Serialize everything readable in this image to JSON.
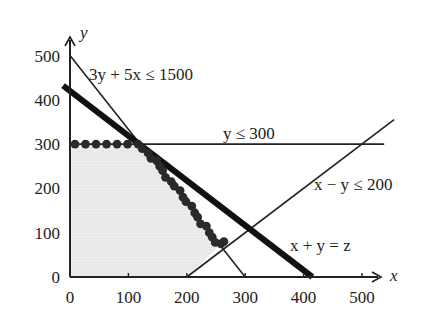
{
  "chart_data": {
    "type": "line",
    "title": "",
    "xlabel": "x",
    "ylabel": "y",
    "xlim": [
      0,
      540
    ],
    "ylim": [
      0,
      530
    ],
    "grid": false,
    "x_ticks": [
      0,
      100,
      200,
      300,
      400,
      500
    ],
    "y_ticks": [
      0,
      100,
      200,
      300,
      400,
      500
    ],
    "x_tick_labels": [
      "0",
      "100",
      "200",
      "300",
      "400",
      "500"
    ],
    "y_tick_labels": [
      "0",
      "100",
      "200",
      "300",
      "400",
      "500"
    ],
    "constraints": [
      {
        "name": "3y + 5x ≤ 1500",
        "points": [
          [
            0,
            500
          ],
          [
            300,
            0
          ]
        ]
      },
      {
        "name": "y ≤ 300",
        "points": [
          [
            0,
            300
          ],
          [
            540,
            300
          ]
        ]
      },
      {
        "name": "x − y ≤ 200",
        "points": [
          [
            200,
            0
          ],
          [
            560,
            360
          ]
        ]
      }
    ],
    "objective": {
      "name": "x + y = z",
      "points": [
        [
          -5,
          425
        ],
        [
          415,
          0
        ]
      ],
      "style": "thick"
    },
    "feasible_region": [
      [
        0,
        0
      ],
      [
        0,
        300
      ],
      [
        120,
        300
      ],
      [
        257,
        72
      ],
      [
        200,
        0
      ]
    ],
    "dots": [
      [
        0,
        300
      ],
      [
        18,
        300
      ],
      [
        36,
        300
      ],
      [
        54,
        300
      ],
      [
        72,
        300
      ],
      [
        90,
        300
      ],
      [
        108,
        300
      ],
      [
        115,
        290
      ],
      [
        125,
        280
      ],
      [
        130,
        268
      ],
      [
        140,
        262
      ],
      [
        145,
        250
      ],
      [
        150,
        240
      ],
      [
        155,
        225
      ],
      [
        165,
        215
      ],
      [
        170,
        205
      ],
      [
        180,
        195
      ],
      [
        185,
        180
      ],
      [
        190,
        170
      ],
      [
        200,
        160
      ],
      [
        205,
        145
      ],
      [
        210,
        135
      ],
      [
        215,
        120
      ],
      [
        225,
        115
      ],
      [
        230,
        100
      ],
      [
        235,
        90
      ],
      [
        240,
        78
      ],
      [
        250,
        75
      ],
      [
        255,
        80
      ]
    ],
    "annotations": [
      {
        "text": "3y + 5x ≤ 1500",
        "at": [
          115,
          470
        ]
      },
      {
        "text": "y ≤ 300",
        "at": [
          270,
          310
        ]
      },
      {
        "text": "x − y ≤ 200",
        "at": [
          380,
          175
        ]
      },
      {
        "text": "x + y = z",
        "at": [
          380,
          65
        ]
      }
    ]
  },
  "labels": {
    "x_axis": "x",
    "y_axis": "y",
    "constraint1": "3y + 5x ≤ 1500",
    "constraint2": "y ≤ 300",
    "constraint3": "x − y ≤ 200",
    "objective": "x + y = z"
  }
}
